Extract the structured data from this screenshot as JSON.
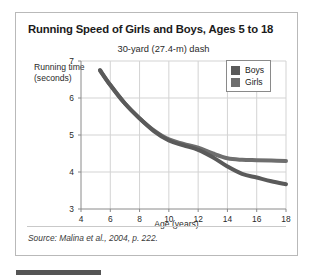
{
  "card": {
    "title": "Running Speed of Girls and Boys, Ages 5 to 18",
    "subtitle": "30-yard (27.4-m) dash",
    "source": "Source: Malina et al., 2004, p. 222."
  },
  "legend": {
    "items": [
      {
        "label": "Boys",
        "color": "#5a5a5a"
      },
      {
        "label": "Girls",
        "color": "#6e6e6e"
      }
    ]
  },
  "colors": {
    "boys": "#5a5a5a",
    "girls": "#6e6e6e",
    "grid": "#d3d3d3",
    "axis": "#8a8a8a",
    "card_border": "#b9b9b9",
    "bottom_bar": "#555555"
  },
  "chart_data": {
    "type": "line",
    "title": "Running Speed of Girls and Boys, Ages 5 to 18",
    "subtitle": "30-yard (27.4-m) dash",
    "xlabel": "Age (years)",
    "ylabel": "Running time (seconds)",
    "xlim": [
      4,
      18
    ],
    "ylim": [
      3,
      7
    ],
    "xticks": [
      4,
      6,
      8,
      10,
      12,
      14,
      16,
      18
    ],
    "yticks": [
      3,
      4,
      5,
      6,
      7
    ],
    "grid": true,
    "legend_position": "top-right",
    "x": [
      5.3,
      6,
      7,
      8,
      9,
      10,
      11,
      12,
      13,
      14,
      15,
      16,
      17,
      18
    ],
    "series": [
      {
        "name": "Boys",
        "values": [
          6.75,
          6.35,
          5.85,
          5.45,
          5.1,
          4.85,
          4.72,
          4.6,
          4.4,
          4.15,
          3.95,
          3.85,
          3.75,
          3.67
        ]
      },
      {
        "name": "Girls",
        "values": [
          6.75,
          6.35,
          5.85,
          5.45,
          5.12,
          4.88,
          4.76,
          4.66,
          4.5,
          4.37,
          4.33,
          4.32,
          4.31,
          4.3
        ]
      }
    ],
    "source": "Source: Malina et al., 2004, p. 222."
  }
}
